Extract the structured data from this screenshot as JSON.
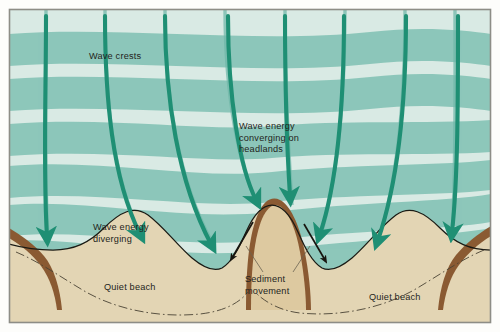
{
  "figure": {
    "labels": {
      "wave_crests": "Wave crests",
      "energy_converging": "Wave energy\nconverging on\nheadlands",
      "energy_diverging": "Wave energy\ndiverging",
      "sediment_movement": "Sediment\nmovement",
      "quiet_beach_left": "Quiet beach",
      "quiet_beach_right": "Quiet beach"
    },
    "colors": {
      "deep_water_light": "#d9eae4",
      "deep_water_band": "#8dc7ba",
      "shallow_water": "#eef3ec",
      "beach_sand": "#e3d5b4",
      "headland_sand": "#ddc9a0",
      "headland_rock": "#8a5a32",
      "arrow_green": "#1f8f74",
      "sediment_arrow": "#17150f",
      "text": "#231f20",
      "frame": "#8d8d86"
    },
    "wave_crest_bands": 8,
    "orthogonal_lines": 7,
    "green_arrows": 7,
    "sediment_arrows": 2,
    "headlands": 3,
    "bays": 2
  }
}
